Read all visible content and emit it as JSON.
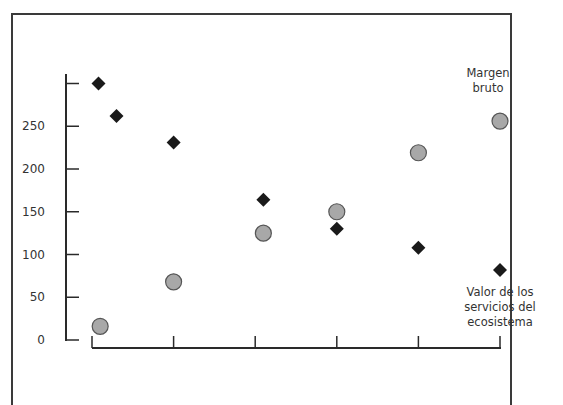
{
  "chart_data": {
    "type": "scatter",
    "title": "",
    "xlabel": "",
    "ylabel": "",
    "ylim": [
      0,
      300
    ],
    "y_ticks": [
      "0",
      "50",
      "100",
      "150",
      "200",
      "250"
    ],
    "x_ticks": 6,
    "grid": false,
    "legend_position": "annotations at right",
    "series": [
      {
        "name": "Valor de los servicios del ecosistema",
        "marker": "diamond",
        "color": "#1a1a1a",
        "points": [
          {
            "x": 0.08,
            "y": 300
          },
          {
            "x": 0.3,
            "y": 262
          },
          {
            "x": 1.0,
            "y": 231
          },
          {
            "x": 2.1,
            "y": 164
          },
          {
            "x": 3.0,
            "y": 130
          },
          {
            "x": 4.0,
            "y": 108
          },
          {
            "x": 5.0,
            "y": 82
          }
        ]
      },
      {
        "name": "Margen bruto",
        "marker": "circle",
        "color": "#a8a8a8",
        "points": [
          {
            "x": 0.1,
            "y": 16
          },
          {
            "x": 1.0,
            "y": 68
          },
          {
            "x": 2.1,
            "y": 125
          },
          {
            "x": 3.0,
            "y": 150
          },
          {
            "x": 4.0,
            "y": 219
          },
          {
            "x": 5.0,
            "y": 256
          }
        ]
      }
    ]
  },
  "labels": {
    "margen_line1": "Margen",
    "margen_line2": "bruto",
    "valor_line1": "Valor de los",
    "valor_line2": "servicios del",
    "valor_line3": "ecosistema"
  }
}
